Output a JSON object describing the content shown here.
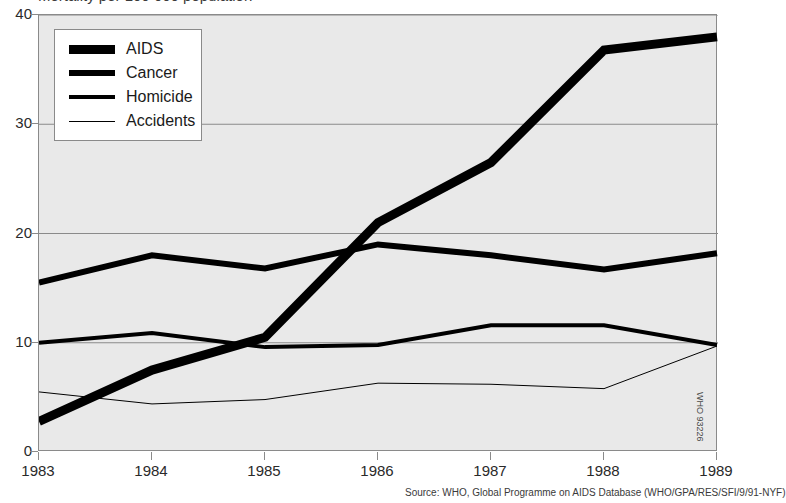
{
  "title": {
    "text": "Mortality per 100 000 population"
  },
  "source_note": "Source: WHO, Global Programme on AIDS Database (WHO/GPA/RES/SFI/9/91-NYF)",
  "doc_code": "WHO 93226",
  "legend": {
    "entries": [
      {
        "label": "AIDS",
        "weight": 9,
        "color": "#000000"
      },
      {
        "label": "Cancer",
        "weight": 6,
        "color": "#000000"
      },
      {
        "label": "Homicide",
        "weight": 4,
        "color": "#000000"
      },
      {
        "label": "Accidents",
        "weight": 1,
        "color": "#000000"
      }
    ]
  },
  "chart_data": {
    "type": "line",
    "title": "Mortality per 100 000 population",
    "xlabel": "",
    "ylabel": "",
    "categories": [
      "1983",
      "1984",
      "1985",
      "1986",
      "1987",
      "1988",
      "1989"
    ],
    "x": [
      1983,
      1984,
      1985,
      1986,
      1987,
      1988,
      1989
    ],
    "xlim": [
      1983,
      1989
    ],
    "ylim": [
      0,
      40
    ],
    "yticks": [
      0,
      10,
      20,
      30,
      40
    ],
    "ytick_labels": [
      "0",
      "10",
      "20",
      "30",
      "40"
    ],
    "grid": true,
    "legend_position": "top-left",
    "series": [
      {
        "name": "AIDS",
        "values": [
          2.8,
          7.5,
          10.5,
          21.0,
          26.5,
          36.8,
          38.0
        ],
        "line_width": 9,
        "color": "#000000"
      },
      {
        "name": "Cancer",
        "values": [
          15.5,
          18.0,
          16.8,
          19.0,
          18.0,
          16.7,
          18.2
        ],
        "line_width": 6,
        "color": "#000000"
      },
      {
        "name": "Homicide",
        "values": [
          10.0,
          10.9,
          9.6,
          9.8,
          11.6,
          11.6,
          9.8
        ],
        "line_width": 4,
        "color": "#000000"
      },
      {
        "name": "Accidents",
        "values": [
          5.5,
          4.4,
          4.8,
          6.3,
          6.2,
          5.8,
          9.7
        ],
        "line_width": 1,
        "color": "#000000"
      }
    ],
    "plot_background": "#e9e9e9",
    "grid_color": "#8a8a8a",
    "page_background": "#ffffff"
  }
}
